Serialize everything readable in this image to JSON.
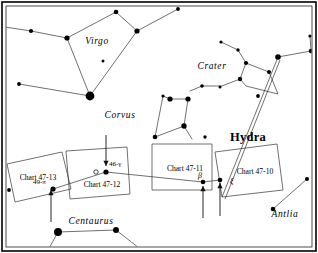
{
  "figure": {
    "type": "star-chart-index-map",
    "background_color": "#ffffff",
    "ink_color": "#000000",
    "border": "double-rule rectangle"
  },
  "constellation_labels": [
    {
      "name": "virgo-label",
      "text": "Virgo",
      "x": 97,
      "y": 44,
      "style": "italic-serif"
    },
    {
      "name": "crater-label",
      "text": "Crater",
      "x": 212,
      "y": 69,
      "style": "italic-serif"
    },
    {
      "name": "corvus-label",
      "text": "Corvus",
      "x": 120,
      "y": 118,
      "style": "italic-serif"
    },
    {
      "name": "hydra-label",
      "text": "Hydra",
      "x": 248,
      "y": 141,
      "style": "bold-serif"
    },
    {
      "name": "antlia-label",
      "text": "Antlia",
      "x": 285,
      "y": 217,
      "style": "italic-serif"
    },
    {
      "name": "centaurus-label",
      "text": "Centaurus",
      "x": 91,
      "y": 224,
      "style": "italic-serif"
    }
  ],
  "chart_boxes": [
    {
      "name": "chart-box-47-13",
      "label": "Chart 47-13",
      "label_x": 38,
      "label_y": 180,
      "points": "7,164 62,152 71,189 15,202"
    },
    {
      "name": "chart-box-47-12",
      "label": "Chart 47-12",
      "label_x": 102,
      "label_y": 187,
      "points": "66,151 127,147 130,194 70,199"
    },
    {
      "name": "chart-box-47-11",
      "label": "Chart 47-11",
      "label_x": 185,
      "label_y": 171,
      "points": "152,144 212,144 212,190 152,190"
    },
    {
      "name": "chart-box-47-10",
      "label": "Chart 47-10",
      "label_x": 255,
      "label_y": 174,
      "points": "215,152 277,144 283,190 222,197"
    }
  ],
  "star_labels": [
    {
      "name": "star-label-49-pi",
      "text": "49-π",
      "x": 33,
      "y": 184,
      "anchor": "start"
    },
    {
      "name": "star-label-46-gamma",
      "text": "46-γ",
      "x": 109,
      "y": 166,
      "anchor": "start"
    },
    {
      "name": "star-label-beta",
      "text": "β",
      "x": 200,
      "y": 178,
      "anchor": "middle"
    },
    {
      "name": "star-label-xi",
      "text": "ξ",
      "x": 230,
      "y": 184,
      "anchor": "start"
    }
  ],
  "arrows": [
    {
      "name": "arrow-to-46-gamma",
      "direction": "down",
      "from_x": 106,
      "from_y": 135,
      "to_x": 106,
      "to_y": 166
    },
    {
      "name": "arrow-to-49-pi",
      "direction": "up",
      "from_x": 51,
      "from_y": 222,
      "to_x": 51,
      "to_y": 190
    },
    {
      "name": "arrow-to-beta",
      "direction": "up",
      "from_x": 203,
      "from_y": 218,
      "to_x": 203,
      "to_y": 186
    },
    {
      "name": "arrow-to-xi",
      "direction": "up",
      "from_x": 220,
      "from_y": 216,
      "to_x": 220,
      "to_y": 183
    }
  ],
  "stars": [
    {
      "name": "star",
      "x": 31,
      "y": 31,
      "r": 2.1
    },
    {
      "name": "star",
      "x": 67,
      "y": 38,
      "r": 2.6
    },
    {
      "name": "star",
      "x": 116,
      "y": 12,
      "r": 2.3
    },
    {
      "name": "star",
      "x": 137,
      "y": 31,
      "r": 2.6
    },
    {
      "name": "star",
      "x": 103,
      "y": 61,
      "r": 1.5
    },
    {
      "name": "star",
      "x": 90,
      "y": 96,
      "r": 4.4
    },
    {
      "name": "star",
      "x": 19,
      "y": 84,
      "r": 1.9
    },
    {
      "name": "star",
      "x": 178,
      "y": 9,
      "r": 1.9
    },
    {
      "name": "star",
      "x": 221,
      "y": 42,
      "r": 1.6
    },
    {
      "name": "star",
      "x": 238,
      "y": 50,
      "r": 1.7
    },
    {
      "name": "star",
      "x": 246,
      "y": 63,
      "r": 2.1
    },
    {
      "name": "star",
      "x": 269,
      "y": 72,
      "r": 2.0
    },
    {
      "name": "star",
      "x": 278,
      "y": 57,
      "r": 2.8
    },
    {
      "name": "star",
      "x": 311,
      "y": 51,
      "r": 2.3
    },
    {
      "name": "star",
      "x": 310,
      "y": 36,
      "r": 1.6
    },
    {
      "name": "star",
      "x": 258,
      "y": 96,
      "r": 1.9
    },
    {
      "name": "star",
      "x": 240,
      "y": 79,
      "r": 2.2
    },
    {
      "name": "star",
      "x": 202,
      "y": 86,
      "r": 1.8
    },
    {
      "name": "star",
      "x": 220,
      "y": 87,
      "r": 1.5
    },
    {
      "name": "star",
      "x": 163,
      "y": 96,
      "r": 1.6
    },
    {
      "name": "star",
      "x": 170,
      "y": 99,
      "r": 2.6
    },
    {
      "name": "star",
      "x": 188,
      "y": 99,
      "r": 2.6
    },
    {
      "name": "star",
      "x": 184,
      "y": 126,
      "r": 2.7
    },
    {
      "name": "star",
      "x": 155,
      "y": 137,
      "r": 2.3
    },
    {
      "name": "star",
      "x": 205,
      "y": 137,
      "r": 1.7
    },
    {
      "name": "star",
      "x": 106,
      "y": 172,
      "r": 2.6
    },
    {
      "name": "star-open",
      "x": 96,
      "y": 172,
      "r": 2.2
    },
    {
      "name": "star",
      "x": 53,
      "y": 189,
      "r": 2.6
    },
    {
      "name": "star",
      "x": 9,
      "y": 190,
      "r": 1.9
    },
    {
      "name": "star",
      "x": 203,
      "y": 182,
      "r": 2.3
    },
    {
      "name": "star",
      "x": 220,
      "y": 180,
      "r": 2.3
    },
    {
      "name": "star",
      "x": 58,
      "y": 232,
      "r": 4.0
    },
    {
      "name": "star",
      "x": 116,
      "y": 230,
      "r": 3.0
    },
    {
      "name": "star",
      "x": 273,
      "y": 209,
      "r": 2.3
    },
    {
      "name": "star",
      "x": 307,
      "y": 179,
      "r": 2.0
    }
  ],
  "constellation_lines": [
    {
      "name": "line-virgo",
      "points": "5,27 31,31 67,38 116,12 137,31 178,9"
    },
    {
      "name": "line-virgo-spica",
      "points": "67,38 90,96 137,31"
    },
    {
      "name": "line-virgo-west",
      "points": "19,84 90,96"
    },
    {
      "name": "line-crater-a",
      "points": "221,42 238,50 246,63 269,72 278,94 246,86 240,79 246,63"
    },
    {
      "name": "line-crater-b",
      "points": "240,79 222,86 202,86 190,91"
    },
    {
      "name": "line-crater-c",
      "points": "278,57 311,51 310,36"
    },
    {
      "name": "line-corvus",
      "points": "155,137 163,96 170,99 188,99 184,126 155,137"
    },
    {
      "name": "line-corvus-tail",
      "points": "184,126 192,139"
    },
    {
      "name": "line-antlia",
      "points": "273,209 307,179"
    },
    {
      "name": "line-centaurus",
      "points": "58,232 116,230 139,248"
    },
    {
      "name": "line-centaurus-b",
      "points": "58,232 47,252"
    },
    {
      "name": "line-belt",
      "points": "53,189 106,172 203,182 220,180"
    },
    {
      "name": "line-hydra-long",
      "points": "278,57 222,197"
    },
    {
      "name": "line-hydra-long2",
      "points": "280,60 225,199"
    }
  ]
}
